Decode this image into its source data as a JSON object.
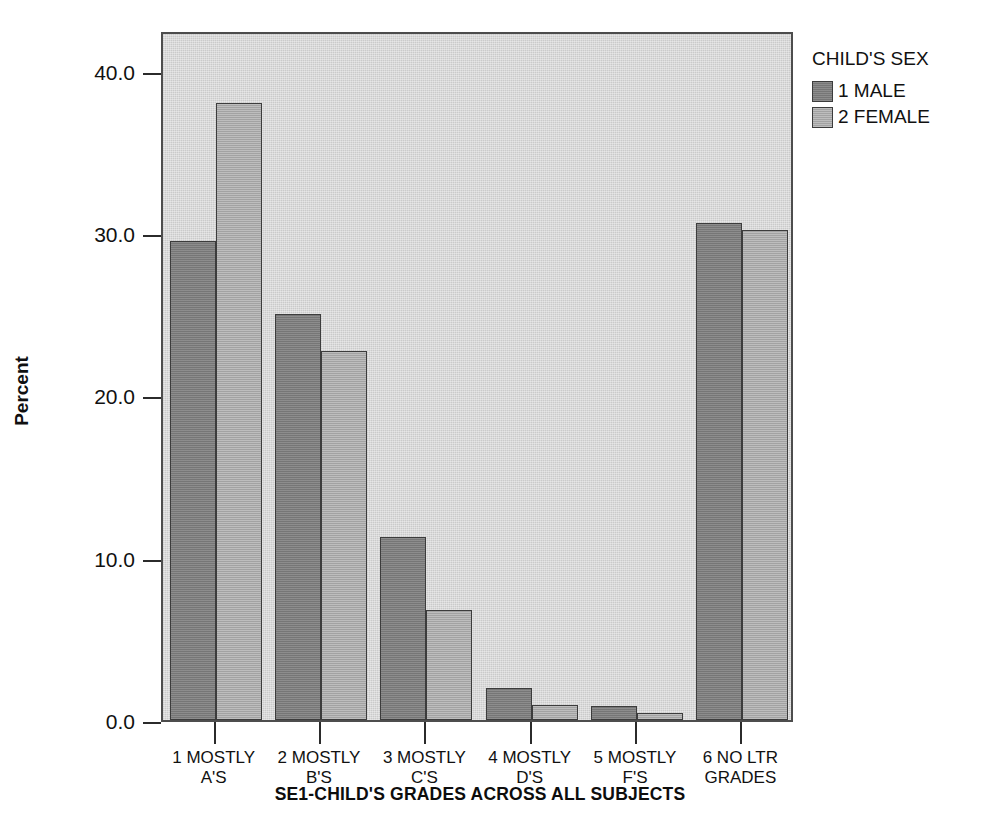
{
  "chart_data": {
    "type": "bar",
    "title": "",
    "xlabel": "SE1-CHILD'S GRADES ACROSS ALL SUBJECTS",
    "ylabel": "Percent",
    "ylim": [
      0.0,
      42.5
    ],
    "yticks": [
      "0.0",
      "10.0",
      "20.0",
      "30.0",
      "40.0"
    ],
    "ytick_values": [
      0.0,
      10.0,
      20.0,
      30.0,
      40.0
    ],
    "grid": false,
    "legend_position": "right",
    "legend_title": "CHILD'S SEX",
    "categories": [
      "1 MOSTLY\nA'S",
      "2 MOSTLY\nB'S",
      "3 MOSTLY\nC'S",
      "4 MOSTLY\nD'S",
      "5 MOSTLY\nF'S",
      "6 NO LTR\nGRADES"
    ],
    "series": [
      {
        "name": "1 MALE",
        "color": "#7d7d7d",
        "values": [
          29.5,
          25.0,
          11.3,
          2.0,
          0.85,
          30.6
        ]
      },
      {
        "name": "2 FEMALE",
        "color": "#ababab",
        "values": [
          38.0,
          22.7,
          6.8,
          0.95,
          0.45,
          30.2
        ]
      }
    ]
  },
  "legend": {
    "title": "CHILD'S SEX",
    "items": [
      {
        "label": "1 MALE",
        "swatch": "male"
      },
      {
        "label": "2 FEMALE",
        "swatch": "female"
      }
    ]
  },
  "axes": {
    "y_title": "Percent",
    "x_title": "SE1-CHILD'S GRADES ACROSS ALL SUBJECTS"
  }
}
